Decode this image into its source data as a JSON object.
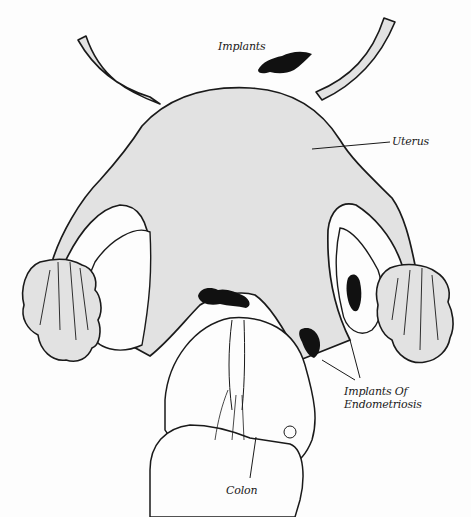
{
  "diagram": {
    "colors": {
      "organ_fill": "#e2e2e2",
      "outline": "#1a1a1a",
      "implant": "#111111",
      "background": "#fdfdfd"
    },
    "labels": {
      "implants_top": "Implants",
      "uterus": "Uterus",
      "implants_of_endometriosis_line1": "Implants Of",
      "implants_of_endometriosis_line2": "Endometriosis",
      "colon": "Colon"
    }
  }
}
